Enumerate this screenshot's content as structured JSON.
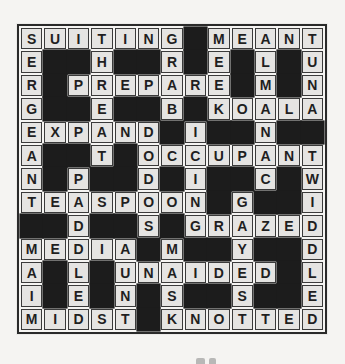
{
  "puzzle": {
    "type": "crossword",
    "size": {
      "rows": 13,
      "cols": 13
    },
    "black_square_symbol": "#",
    "rows": [
      "SUITING#MEANT",
      "E##H##R#E#L#U",
      "R#PREPARE#M#N",
      "G##E##B#KOALA",
      "EXPAND#I##N##",
      "A##T#OCCUPANT",
      "N#P##D#I##C#W",
      "TEASPOON#G##I",
      "##D##S#GRAZED",
      "MEDIA#M##Y##D",
      "A#L#UNAIDED#L",
      "I#E#N#S##S##E",
      "MIDST#KNOTTED"
    ],
    "visible_across_words": [
      "SUITING",
      "MEANT",
      "PREPARE",
      "KOALA",
      "EXPAND",
      "OCCUPANT",
      "TEASPOON",
      "GRAZED",
      "MEDIA",
      "UNAIDED",
      "MIDST",
      "KNOTTED"
    ],
    "visible_down_words": [
      "SERGEANT",
      "MAIM",
      "THREAT",
      "PADDLED",
      "DODOS",
      "ICING",
      "GRAB",
      "MASK",
      "MEEK",
      "GAYEST",
      "ALMANAC",
      "TUNA",
      "TWIDDLED",
      "AUNT"
    ],
    "colors": {
      "page_bg": "#f5f4f2",
      "cell_fill": "#e5e4e2",
      "cell_border": "#3a3a3a",
      "black_cell": "#1c1c1c",
      "letter": "#1f1f1f",
      "grid_border": "#2a2a2a",
      "gap": "#f5f4f2"
    }
  }
}
